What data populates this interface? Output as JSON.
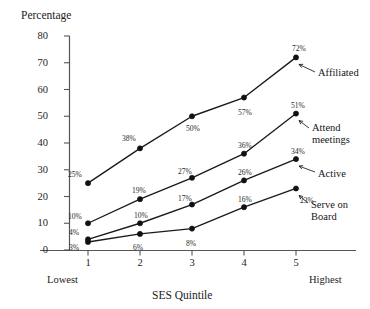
{
  "chart_data": {
    "type": "line",
    "title": "",
    "xlabel": "SES Quintile",
    "ylabel": "Percentage",
    "categories": [
      "1",
      "2",
      "3",
      "4",
      "5"
    ],
    "x_axis_endcaps": {
      "low": "Lowest",
      "high": "Highest"
    },
    "xlim": [
      0.6,
      5.45
    ],
    "ylim": [
      0,
      80
    ],
    "yticks": [
      "80",
      "70",
      "60",
      "50",
      "40",
      "30",
      "20",
      "10",
      "0"
    ],
    "ytick_values": [
      80,
      70,
      60,
      50,
      40,
      30,
      20,
      10,
      0
    ],
    "grid": false,
    "legend_position": "right-inline-annotations",
    "marker": "filled-circle",
    "series": [
      {
        "name": "Affiliated",
        "label": "Affiliated",
        "values": [
          25,
          38,
          50,
          57,
          72
        ],
        "point_labels": [
          "25%",
          "38%",
          "50%",
          "57%",
          "72%"
        ],
        "label_offsets": [
          {
            "dx": -20,
            "dy": -12
          },
          {
            "dx": -18,
            "dy": -13
          },
          {
            "dx": -6,
            "dy": 9
          },
          {
            "dx": -6,
            "dy": 11
          },
          {
            "dx": -4,
            "dy": -12
          }
        ]
      },
      {
        "name": "Attend meetings",
        "label": "Attend\nmeetings",
        "values": [
          10,
          19,
          27,
          36,
          51
        ],
        "point_labels": [
          "10%",
          "19%",
          "27%",
          "36%",
          "51%"
        ],
        "label_offsets": [
          {
            "dx": -20,
            "dy": -10
          },
          {
            "dx": -8,
            "dy": -12
          },
          {
            "dx": -14,
            "dy": -10
          },
          {
            "dx": -6,
            "dy": -12
          },
          {
            "dx": -5,
            "dy": -12
          }
        ]
      },
      {
        "name": "Active",
        "label": "Active",
        "values": [
          4,
          10,
          17,
          26,
          34
        ],
        "point_labels": [
          "4%",
          "10%",
          "17%",
          "26%",
          "34%"
        ],
        "label_offsets": [
          {
            "dx": -19,
            "dy": -10
          },
          {
            "dx": -6,
            "dy": -11
          },
          {
            "dx": -14,
            "dy": -10
          },
          {
            "dx": -6,
            "dy": -11
          },
          {
            "dx": -5,
            "dy": -11
          }
        ]
      },
      {
        "name": "Serve on Board",
        "label": "Serve on\nBoard",
        "values": [
          3,
          6,
          8,
          16,
          23
        ],
        "point_labels": [
          "3%",
          "6%",
          "8%",
          "16%",
          "23%"
        ],
        "label_offsets": [
          {
            "dx": -19,
            "dy": 2
          },
          {
            "dx": -7,
            "dy": 10
          },
          {
            "dx": -6,
            "dy": 11
          },
          {
            "dx": -6,
            "dy": -11
          },
          {
            "dx": 4,
            "dy": 9
          }
        ]
      }
    ],
    "annotations": [
      {
        "text": "Affiliated",
        "series": "Affiliated",
        "x": 318,
        "y": 72
      },
      {
        "text": "Attend meetings",
        "series": "Attend meetings",
        "x": 312,
        "y": 128
      },
      {
        "text": "Active",
        "series": "Active",
        "x": 318,
        "y": 172
      },
      {
        "text": "Serve on Board",
        "series": "Serve on Board",
        "x": 311,
        "y": 203
      }
    ],
    "colors": {
      "line": "#1a1a1a",
      "marker": "#111111",
      "axis": "#555555",
      "text": "#1c1c1c",
      "label_text": "#2a2a2a",
      "background": "#ffffff"
    }
  }
}
